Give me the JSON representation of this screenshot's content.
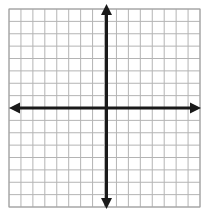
{
  "figure": {
    "name": "blank-coordinate-grid",
    "width": 206,
    "height": 214,
    "background_color": "#ffffff",
    "caption": ""
  },
  "chart_data": {
    "type": "scatter",
    "title": "",
    "subtitle": "",
    "xlabel": "",
    "ylabel": "",
    "series": [
      {
        "name": "",
        "x": [],
        "y": []
      }
    ],
    "x": [],
    "values": [],
    "categories": [],
    "xlim": [
      -8,
      8
    ],
    "ylim": [
      -8,
      8
    ],
    "xticks": [
      -8,
      -7,
      -6,
      -5,
      -4,
      -3,
      -2,
      -1,
      0,
      1,
      2,
      3,
      4,
      5,
      6,
      7,
      8
    ],
    "yticks": [
      -8,
      -7,
      -6,
      -5,
      -4,
      -3,
      -2,
      -1,
      0,
      1,
      2,
      3,
      4,
      5,
      6,
      7,
      8
    ],
    "xtick_labels": [],
    "ytick_labels": [],
    "grid": true,
    "grid_columns": 16,
    "grid_rows": 16,
    "legend": [],
    "legend_position": "none",
    "annotations": [],
    "axis_style": "double-headed-arrows",
    "origin": {
      "x": 0,
      "y": 0
    }
  },
  "style": {
    "grid_line_color": "#b4b4b4",
    "grid_border_color": "#a0a0a0",
    "axis_color": "#1a1a1a",
    "background_color": "#ffffff",
    "grid_line_width": 1,
    "axis_line_width": 3
  },
  "geometry": {
    "grid_left": 9,
    "grid_top": 9,
    "grid_right": 200,
    "grid_bottom": 207,
    "cell_width": 11.9375,
    "cell_height": 12.375,
    "origin_px_x": 106.5,
    "origin_px_y": 108,
    "x_axis_start": 9,
    "x_axis_end": 201,
    "y_axis_start": 4,
    "y_axis_end": 209
  },
  "labels": {
    "x_axis_name": "x-axis",
    "y_axis_name": "y-axis",
    "arrow_left": "left-arrowhead",
    "arrow_right": "right-arrowhead",
    "arrow_up": "up-arrowhead",
    "arrow_down": "down-arrowhead"
  }
}
